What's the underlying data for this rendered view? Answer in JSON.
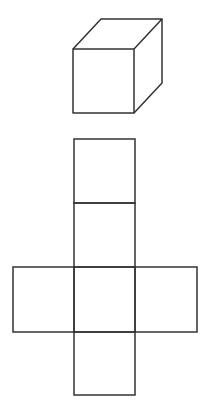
{
  "figure": {
    "stroke_color": "#333333",
    "background": "#ffffff",
    "cube": {
      "front_face": {
        "x": 73,
        "y": 49,
        "w": 61,
        "h": 64
      },
      "depth_offset": {
        "dx": 28,
        "dy": -30
      }
    },
    "net": {
      "column_x": 74,
      "cell_w": 61,
      "row_edges_y": [
        139,
        203,
        267,
        332,
        395
      ],
      "arm_left_x": 13,
      "arm_right_x": 197,
      "arm_row": 2,
      "faces": 6
    }
  }
}
